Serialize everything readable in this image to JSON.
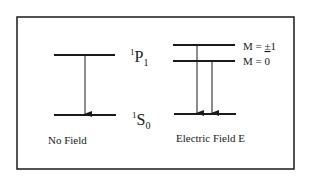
{
  "diagram": {
    "states": {
      "upper": {
        "sup": "1",
        "letter": "P",
        "sub": "1"
      },
      "lower": {
        "sup": "1",
        "letter": "S",
        "sub": "0"
      }
    },
    "sublevels": [
      {
        "label": "M = ±1",
        "prefix": "M = ",
        "pm": "±",
        "value": "1"
      },
      {
        "label": "M = 0"
      }
    ],
    "captions": {
      "left": "No Field",
      "right": "Electric Field E"
    },
    "colors": {
      "line": "#1a1a1a",
      "background": "#ffffff"
    }
  }
}
